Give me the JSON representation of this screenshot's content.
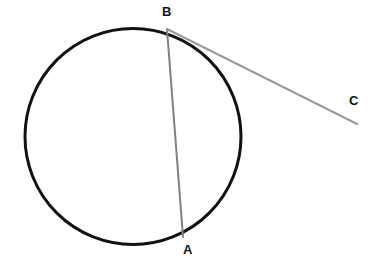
{
  "figure": {
    "background_color": "#ffffff",
    "width": 376,
    "height": 275
  },
  "labels": {
    "point_a": "A",
    "point_b": "B",
    "point_c": "C"
  },
  "colors": {
    "circle_stroke": "#111111",
    "chord_stroke": "#808080",
    "tangent_stroke": "#9a9a9a",
    "label_text": "#141414"
  },
  "chart_data": {
    "type": "diagram",
    "subtype": "euclidean-geometry",
    "coordinate_space": {
      "width": 376,
      "height": 275,
      "origin": "top-left"
    },
    "shapes": [
      {
        "name": "circle",
        "kind": "circle",
        "cx": 133,
        "cy": 136.5,
        "r": 108,
        "stroke": "#111111",
        "stroke_width": 3,
        "fill": "none"
      },
      {
        "name": "chord-BA",
        "kind": "line",
        "from": "B",
        "to": "A",
        "x1": 167,
        "y1": 29,
        "x2": 183,
        "y2": 237,
        "stroke": "#808080",
        "stroke_width": 2
      },
      {
        "name": "tangent-BC",
        "kind": "line",
        "from": "B",
        "to": "C",
        "x1": 167,
        "y1": 29,
        "x2": 357,
        "y2": 124,
        "stroke": "#9a9a9a",
        "stroke_width": 2
      }
    ],
    "points": [
      {
        "name": "A",
        "label": "A",
        "x": 183,
        "y": 237,
        "on_circle": true,
        "label_x": 183,
        "label_y": 243
      },
      {
        "name": "B",
        "label": "B",
        "x": 167,
        "y": 29,
        "on_circle": true,
        "label_x": 162,
        "label_y": 5
      },
      {
        "name": "C",
        "label": "C",
        "x": 357,
        "y": 124,
        "on_circle": false,
        "label_x": 349,
        "label_y": 94
      }
    ],
    "annotations": []
  }
}
